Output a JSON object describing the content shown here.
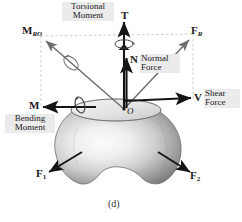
{
  "figure": {
    "caption": "(d)",
    "background_color": "#ffffff",
    "ink_color": "#1a1a1a",
    "arrow_gray": "#6e6e6e",
    "dashed_gray": "#b9b9b9",
    "body_fill_light": "#f2f2f2",
    "body_fill_dark": "#7d7d7d",
    "label_panel": "#ebebeb"
  },
  "origin": {
    "symbol": "O"
  },
  "vectors": {
    "torsional": {
      "symbol": "T",
      "symbol_sub": ""
    },
    "resultant_moment": {
      "symbol": "M",
      "symbol_sub": "R",
      "symbol_sub2": "O"
    },
    "resultant_force": {
      "symbol": "F",
      "symbol_sub": "R"
    },
    "normal": {
      "symbol": "N"
    },
    "shear": {
      "symbol": "V"
    },
    "bending": {
      "symbol": "M"
    },
    "force1": {
      "symbol": "F",
      "symbol_sub": "1"
    },
    "force2": {
      "symbol": "F",
      "symbol_sub": "2"
    }
  },
  "annotations": {
    "torsional_moment_line1": "Torsional",
    "torsional_moment_line2": "Moment",
    "normal_force_line1": "Normal",
    "normal_force_line2": "Force",
    "shear_force_line1": "Shear",
    "shear_force_line2": "Force",
    "bending_moment_line1": "Bending",
    "bending_moment_line2": "Moment"
  }
}
